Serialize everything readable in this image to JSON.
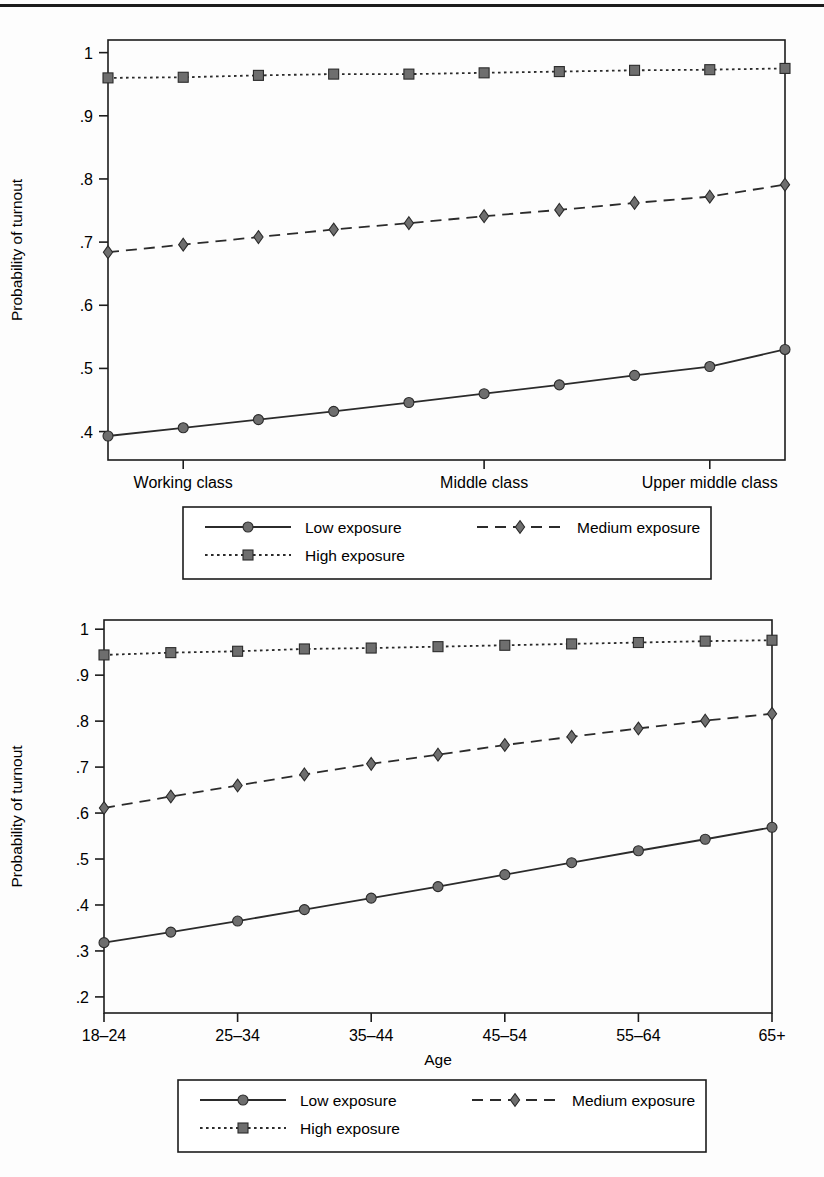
{
  "figure": {
    "panels": [
      {
        "id": "panel-class",
        "ylabel": "Probability of turnout",
        "xlabel": "",
        "yticks": [
          "1",
          ".9",
          ".8",
          ".7",
          ".6",
          ".5",
          ".4"
        ],
        "ytickvals": [
          1.0,
          0.9,
          0.8,
          0.7,
          0.6,
          0.5,
          0.4
        ],
        "xticks": [
          "Working class",
          "Middle class",
          "Upper middle class"
        ],
        "xtickpos": [
          1,
          5,
          8
        ],
        "legend": [
          {
            "label": "Low exposure",
            "style": "solid",
            "marker": "circle"
          },
          {
            "label": "Medium exposure",
            "style": "dashed",
            "marker": "diamond"
          },
          {
            "label": "High exposure",
            "style": "dotted",
            "marker": "square"
          }
        ]
      },
      {
        "id": "panel-age",
        "ylabel": "Probability of turnout",
        "xlabel": "Age",
        "yticks": [
          "1",
          ".9",
          ".8",
          ".7",
          ".6",
          ".5",
          ".4",
          ".3",
          ".2"
        ],
        "ytickvals": [
          1.0,
          0.9,
          0.8,
          0.7,
          0.6,
          0.5,
          0.4,
          0.3,
          0.2
        ],
        "xticks": [
          "18–24",
          "25–34",
          "35–44",
          "45–54",
          "55–64",
          "65+"
        ],
        "xtickpos": [
          0,
          2,
          4,
          6,
          8,
          10
        ],
        "legend": [
          {
            "label": "Low exposure",
            "style": "solid",
            "marker": "circle"
          },
          {
            "label": "Medium exposure",
            "style": "dashed",
            "marker": "diamond"
          },
          {
            "label": "High exposure",
            "style": "dotted",
            "marker": "square"
          }
        ]
      }
    ]
  },
  "colors": {
    "line": "#2b2b2b",
    "marker_fill": "#6e6e6e",
    "marker_stroke": "#2b2b2b",
    "axis": "#1c1c1c",
    "background": "#ffffff"
  },
  "chart_data": [
    {
      "type": "line",
      "title": "",
      "xlabel": "",
      "ylabel": "Probability of turnout",
      "ylim": [
        0.355,
        1.02
      ],
      "grid": false,
      "legend_position": "below",
      "x": [
        0,
        1,
        2,
        3,
        4,
        5,
        6,
        7,
        8,
        9
      ],
      "xticklabels": [
        "Working class",
        "Middle class",
        "Upper middle class"
      ],
      "xticklabel_positions": [
        1,
        5,
        8
      ],
      "series": [
        {
          "name": "Low exposure",
          "style": "solid",
          "marker": "circle",
          "values": [
            0.393,
            0.406,
            0.419,
            0.432,
            0.446,
            0.46,
            0.474,
            0.489,
            0.503,
            0.53
          ]
        },
        {
          "name": "Medium exposure",
          "style": "dashed",
          "marker": "diamond",
          "values": [
            0.684,
            0.696,
            0.708,
            0.72,
            0.73,
            0.741,
            0.751,
            0.762,
            0.772,
            0.791
          ]
        },
        {
          "name": "High exposure",
          "style": "dotted",
          "marker": "square",
          "values": [
            0.96,
            0.961,
            0.964,
            0.966,
            0.966,
            0.968,
            0.97,
            0.972,
            0.973,
            0.975
          ]
        }
      ]
    },
    {
      "type": "line",
      "title": "",
      "xlabel": "Age",
      "ylabel": "Probability of turnout",
      "ylim": [
        0.165,
        1.02
      ],
      "grid": false,
      "legend_position": "below",
      "x": [
        0,
        1,
        2,
        3,
        4,
        5,
        6,
        7,
        8,
        9,
        10
      ],
      "xticklabels": [
        "18–24",
        "25–34",
        "35–44",
        "45–54",
        "55–64",
        "65+"
      ],
      "xticklabel_positions": [
        0,
        2,
        4,
        6,
        8,
        10
      ],
      "series": [
        {
          "name": "Low exposure",
          "style": "solid",
          "marker": "circle",
          "values": [
            0.318,
            0.341,
            0.365,
            0.39,
            0.415,
            0.44,
            0.466,
            0.492,
            0.518,
            0.543,
            0.569
          ]
        },
        {
          "name": "Medium exposure",
          "style": "dashed",
          "marker": "diamond",
          "values": [
            0.611,
            0.636,
            0.66,
            0.684,
            0.707,
            0.727,
            0.748,
            0.766,
            0.784,
            0.801,
            0.816
          ]
        },
        {
          "name": "High exposure",
          "style": "dotted",
          "marker": "square",
          "values": [
            0.944,
            0.949,
            0.952,
            0.957,
            0.959,
            0.962,
            0.965,
            0.968,
            0.971,
            0.974,
            0.976
          ]
        }
      ]
    }
  ]
}
